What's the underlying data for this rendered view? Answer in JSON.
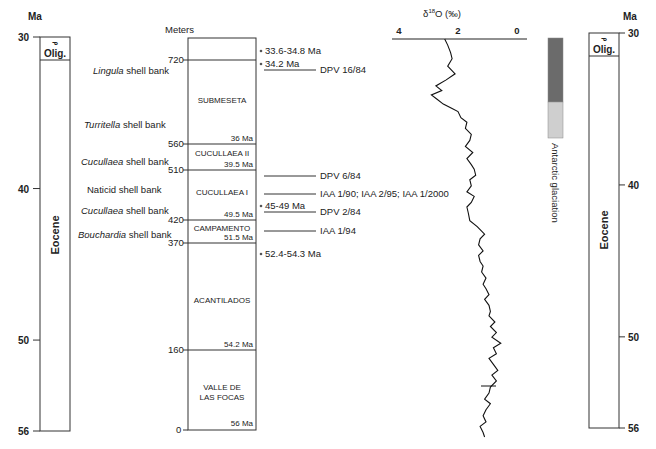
{
  "left_timescale": {
    "unit_label": "Ma",
    "ticks": [
      {
        "label": "30",
        "ma": 30
      },
      {
        "label": "40",
        "ma": 40
      },
      {
        "label": "50",
        "ma": 50
      },
      {
        "label": "56",
        "ma": 56
      }
    ],
    "epochs": [
      {
        "name": "Olig.",
        "from_ma": 30,
        "to_ma": 31,
        "symbol": "ᓀ"
      },
      {
        "name": "Eocene",
        "from_ma": 31,
        "to_ma": 56
      }
    ]
  },
  "right_timescale": {
    "unit_label": "Ma",
    "ticks": [
      {
        "label": "30",
        "ma": 30
      },
      {
        "label": "40",
        "ma": 40
      },
      {
        "label": "50",
        "ma": 50
      },
      {
        "label": "56",
        "ma": 56
      }
    ],
    "epochs": [
      {
        "name": "Olig.",
        "from_ma": 30,
        "to_ma": 31,
        "symbol": "ᓀ"
      },
      {
        "name": "Eocene",
        "from_ma": 31,
        "to_ma": 56
      }
    ]
  },
  "shell_banks": [
    {
      "genus": "Lingula",
      "rest": " shell bank",
      "italic": true
    },
    {
      "genus": "Turritella",
      "rest": " shell bank",
      "italic": true
    },
    {
      "genus": "Cucullaea",
      "rest": " shell bank",
      "italic": true
    },
    {
      "genus": "Naticid",
      "rest": " shell bank",
      "italic": false
    },
    {
      "genus": "Cucullaea",
      "rest": " shell bank",
      "italic": true
    },
    {
      "genus": "Bouchardia",
      "rest": " shell bank",
      "italic": true
    }
  ],
  "stratigraphic_column": {
    "axis_label": "Meters",
    "meter_ticks": [
      "720",
      "560",
      "510",
      "420",
      "370",
      "160",
      "0"
    ],
    "units": [
      {
        "name": "SUBMESETA",
        "base_age": "36 Ma"
      },
      {
        "name": "CUCULLAEA II",
        "base_age": "39.5 Ma"
      },
      {
        "name": "CUCULLAEA I",
        "base_age": "49.5 Ma"
      },
      {
        "name": "CAMPAMENTO",
        "base_age": "51.5 Ma"
      },
      {
        "name": "ACANTILADOS",
        "base_age": "54.2 Ma"
      },
      {
        "name": "VALLE DE",
        "name2": "LAS FOCAS",
        "base_age": "56 Ma"
      }
    ]
  },
  "dates": [
    {
      "label": "33.6-34.8 Ma"
    },
    {
      "label": "34.2 Ma"
    },
    {
      "label": "45-49 Ma"
    },
    {
      "label": "52.4-54.3 Ma"
    }
  ],
  "localities": [
    {
      "label": "DPV 16/84"
    },
    {
      "label": "DPV 6/84"
    },
    {
      "label": "IAA 1/90; IAA 2/95; IAA 1/2000"
    },
    {
      "label": "DPV 2/84"
    },
    {
      "label": "IAA 1/94"
    }
  ],
  "chart_data": {
    "type": "line",
    "title": "δ18O (‰)",
    "title_main": "δ",
    "title_sup": "18",
    "title_rest": "O (‰)",
    "xlabel": "δ18O (‰)",
    "ylabel": "Ma",
    "xlim": [
      4,
      0
    ],
    "ylim": [
      30,
      56
    ],
    "x_ticks": [
      "4",
      "2",
      "0"
    ],
    "grid": false,
    "series": [
      {
        "name": "δ18O",
        "points": [
          [
            2.45,
            30.0
          ],
          [
            2.35,
            30.4
          ],
          [
            2.25,
            30.9
          ],
          [
            2.2,
            31.3
          ],
          [
            2.35,
            31.8
          ],
          [
            2.1,
            32.3
          ],
          [
            2.4,
            32.7
          ],
          [
            2.75,
            33.1
          ],
          [
            2.55,
            33.4
          ],
          [
            2.9,
            33.7
          ],
          [
            2.7,
            34.0
          ],
          [
            2.5,
            34.3
          ],
          [
            2.2,
            34.6
          ],
          [
            2.0,
            34.8
          ],
          [
            1.9,
            35.2
          ],
          [
            1.7,
            35.5
          ],
          [
            1.75,
            35.9
          ],
          [
            1.55,
            36.3
          ],
          [
            1.6,
            36.7
          ],
          [
            1.75,
            37.1
          ],
          [
            1.5,
            37.5
          ],
          [
            1.7,
            37.9
          ],
          [
            1.55,
            38.3
          ],
          [
            1.45,
            38.6
          ],
          [
            1.4,
            39.0
          ],
          [
            1.6,
            39.3
          ],
          [
            1.55,
            39.7
          ],
          [
            1.7,
            40.1
          ],
          [
            1.45,
            40.4
          ],
          [
            1.55,
            40.8
          ],
          [
            1.7,
            41.1
          ],
          [
            1.65,
            41.5
          ],
          [
            1.6,
            42.0
          ],
          [
            1.35,
            42.4
          ],
          [
            1.1,
            42.9
          ],
          [
            1.25,
            43.2
          ],
          [
            1.3,
            43.6
          ],
          [
            1.15,
            44.0
          ],
          [
            1.3,
            44.3
          ],
          [
            1.25,
            44.7
          ],
          [
            1.15,
            45.0
          ],
          [
            1.2,
            45.4
          ],
          [
            1.05,
            45.8
          ],
          [
            1.15,
            46.2
          ],
          [
            1.05,
            46.5
          ],
          [
            0.95,
            46.9
          ],
          [
            1.1,
            47.2
          ],
          [
            0.95,
            47.6
          ],
          [
            0.9,
            48.0
          ],
          [
            0.95,
            48.3
          ],
          [
            0.75,
            48.7
          ],
          [
            0.9,
            49.0
          ],
          [
            0.7,
            49.4
          ],
          [
            0.85,
            49.7
          ],
          [
            0.55,
            50.1
          ],
          [
            0.8,
            50.4
          ],
          [
            0.7,
            50.8
          ],
          [
            0.95,
            51.1
          ],
          [
            0.8,
            51.5
          ],
          [
            0.65,
            51.9
          ],
          [
            0.85,
            52.2
          ],
          [
            0.7,
            52.6
          ],
          [
            0.9,
            53.0
          ],
          [
            0.95,
            53.4
          ],
          [
            1.1,
            53.8
          ],
          [
            0.9,
            54.1
          ],
          [
            1.05,
            54.5
          ],
          [
            1.15,
            54.9
          ],
          [
            1.05,
            55.3
          ],
          [
            1.25,
            55.6
          ],
          [
            1.15,
            56.0
          ],
          [
            1.1,
            56.3
          ]
        ]
      }
    ],
    "annotations": [
      {
        "text": "Antarctic glaciation",
        "from_ma": 30.1,
        "to_ma": 38.5,
        "intense_until_ma": 35.8
      }
    ]
  },
  "glaciation": {
    "label": "Antarctic glaciation",
    "dark_color": "#6b6b6b",
    "light_color": "#cfcfcf"
  }
}
